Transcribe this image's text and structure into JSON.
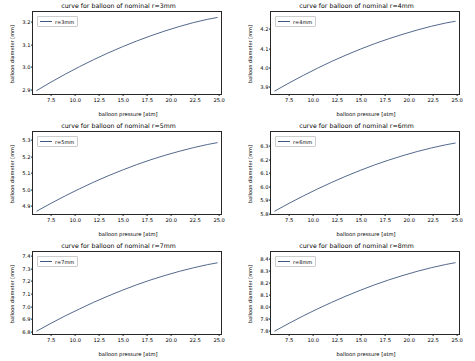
{
  "figure": {
    "background": "#ffffff",
    "line_color": "#40587f",
    "rows": 3,
    "cols": 2
  },
  "chart_data": [
    {
      "type": "line",
      "title": "curve for balloon of nominal r=3mm",
      "xlabel": "balloon pressure [atm]",
      "ylabel": "balloon diameter [mm]",
      "legend": [
        "r=3mm"
      ],
      "legend_position": "upper left",
      "grid": false,
      "xlim": [
        5.6,
        25.4
      ],
      "ylim": [
        2.872,
        3.244
      ],
      "xticks": [
        "7.5",
        "10.0",
        "12.5",
        "15.0",
        "17.5",
        "20.0",
        "22.5",
        "25.0"
      ],
      "xtick_values": [
        7.5,
        10.0,
        12.5,
        15.0,
        17.5,
        20.0,
        22.5,
        25.0
      ],
      "yticks": [
        "2.9",
        "3.0",
        "3.1",
        "3.2"
      ],
      "ytick_values": [
        2.9,
        3.0,
        3.1,
        3.2
      ],
      "x": [
        6.0,
        7.5,
        9.0,
        10.5,
        12.0,
        13.5,
        15.0,
        16.5,
        18.0,
        19.5,
        21.0,
        22.5,
        24.0,
        25.0
      ],
      "y": [
        2.888,
        2.926,
        2.962,
        2.996,
        3.028,
        3.058,
        3.086,
        3.112,
        3.136,
        3.158,
        3.178,
        3.196,
        3.211,
        3.219
      ]
    },
    {
      "type": "line",
      "title": "curve for balloon of nominal r=4mm",
      "xlabel": "balloon pressure [atm]",
      "ylabel": "balloon diameter [mm]",
      "legend": [
        "r=4mm"
      ],
      "legend_position": "upper left",
      "grid": false,
      "xlim": [
        5.6,
        25.4
      ],
      "ylim": [
        3.856,
        4.288
      ],
      "xticks": [
        "7.5",
        "10.0",
        "12.5",
        "15.0",
        "17.5",
        "20.0",
        "22.5",
        "25.0"
      ],
      "xtick_values": [
        7.5,
        10.0,
        12.5,
        15.0,
        17.5,
        20.0,
        22.5,
        25.0
      ],
      "yticks": [
        "3.9",
        "4.0",
        "4.1",
        "4.2"
      ],
      "ytick_values": [
        3.9,
        4.0,
        4.1,
        4.2
      ],
      "x": [
        6.0,
        7.5,
        9.0,
        10.5,
        12.0,
        13.5,
        15.0,
        16.5,
        18.0,
        19.5,
        21.0,
        22.5,
        24.0,
        25.0
      ],
      "y": [
        3.872,
        3.914,
        3.954,
        3.992,
        4.028,
        4.061,
        4.092,
        4.121,
        4.147,
        4.171,
        4.193,
        4.213,
        4.23,
        4.239
      ]
    },
    {
      "type": "line",
      "title": "curve for balloon of nominal r=5mm",
      "xlabel": "balloon pressure [atm]",
      "ylabel": "balloon diameter [mm]",
      "legend": [
        "r=5mm"
      ],
      "legend_position": "upper left",
      "grid": false,
      "xlim": [
        5.6,
        25.4
      ],
      "ylim": [
        4.838,
        5.352
      ],
      "xticks": [
        "7.5",
        "10.0",
        "12.5",
        "15.0",
        "17.5",
        "20.0",
        "22.5",
        "25.0"
      ],
      "xtick_values": [
        7.5,
        10.0,
        12.5,
        15.0,
        17.5,
        20.0,
        22.5,
        25.0
      ],
      "yticks": [
        "4.9",
        "5.0",
        "5.1",
        "5.2",
        "5.3"
      ],
      "ytick_values": [
        4.9,
        5.0,
        5.1,
        5.2,
        5.3
      ],
      "x": [
        6.0,
        7.5,
        9.0,
        10.5,
        12.0,
        13.5,
        15.0,
        16.5,
        18.0,
        19.5,
        21.0,
        22.5,
        24.0,
        25.0
      ],
      "y": [
        4.856,
        4.905,
        4.952,
        4.996,
        5.038,
        5.077,
        5.113,
        5.147,
        5.178,
        5.206,
        5.231,
        5.254,
        5.274,
        5.285
      ]
    },
    {
      "type": "line",
      "title": "curve for balloon of nominal r=6mm",
      "xlabel": "balloon pressure [atm]",
      "ylabel": "balloon diameter [mm]",
      "legend": [
        "r=6mm"
      ],
      "legend_position": "upper left",
      "grid": false,
      "xlim": [
        5.6,
        25.4
      ],
      "ylim": [
        5.782,
        6.404
      ],
      "xticks": [
        "7.5",
        "10.0",
        "12.5",
        "15.0",
        "17.5",
        "20.0",
        "22.5",
        "25.0"
      ],
      "xtick_values": [
        7.5,
        10.0,
        12.5,
        15.0,
        17.5,
        20.0,
        22.5,
        25.0
      ],
      "yticks": [
        "5.8",
        "5.9",
        "6.0",
        "6.1",
        "6.2",
        "6.3"
      ],
      "ytick_values": [
        5.8,
        5.9,
        6.0,
        6.1,
        6.2,
        6.3
      ],
      "x": [
        6.0,
        7.5,
        9.0,
        10.5,
        12.0,
        13.5,
        15.0,
        16.5,
        18.0,
        19.5,
        21.0,
        22.5,
        24.0,
        25.0
      ],
      "y": [
        5.804,
        5.863,
        5.919,
        5.972,
        6.022,
        6.069,
        6.113,
        6.154,
        6.191,
        6.225,
        6.256,
        6.283,
        6.307,
        6.32
      ]
    },
    {
      "type": "line",
      "title": "curve for balloon of nominal r=7mm",
      "xlabel": "balloon pressure [atm]",
      "ylabel": "balloon diameter [mm]",
      "legend": [
        "r=7mm"
      ],
      "legend_position": "upper left",
      "grid": false,
      "xlim": [
        5.6,
        25.4
      ],
      "ylim": [
        6.768,
        7.432
      ],
      "xticks": [
        "7.5",
        "10.0",
        "12.5",
        "15.0",
        "17.5",
        "20.0",
        "22.5",
        "25.0"
      ],
      "xtick_values": [
        7.5,
        10.0,
        12.5,
        15.0,
        17.5,
        20.0,
        22.5,
        25.0
      ],
      "yticks": [
        "6.8",
        "6.9",
        "7.0",
        "7.1",
        "7.2",
        "7.3",
        "7.4"
      ],
      "ytick_values": [
        6.8,
        6.9,
        7.0,
        7.1,
        7.2,
        7.3,
        7.4
      ],
      "x": [
        6.0,
        7.5,
        9.0,
        10.5,
        12.0,
        13.5,
        15.0,
        16.5,
        18.0,
        19.5,
        21.0,
        22.5,
        24.0,
        25.0
      ],
      "y": [
        6.792,
        6.855,
        6.915,
        6.971,
        7.025,
        7.075,
        7.122,
        7.166,
        7.206,
        7.242,
        7.275,
        7.304,
        7.33,
        7.344
      ]
    },
    {
      "type": "line",
      "title": "curve for balloon of nominal r=8mm",
      "xlabel": "balloon pressure [atm]",
      "ylabel": "balloon diameter [mm]",
      "legend": [
        "r=8mm"
      ],
      "legend_position": "upper left",
      "grid": false,
      "xlim": [
        5.6,
        25.4
      ],
      "ylim": [
        7.762,
        8.458
      ],
      "xticks": [
        "7.5",
        "10.0",
        "12.5",
        "15.0",
        "17.5",
        "20.0",
        "22.5",
        "25.0"
      ],
      "xtick_values": [
        7.5,
        10.0,
        12.5,
        15.0,
        17.5,
        20.0,
        22.5,
        25.0
      ],
      "yticks": [
        "7.8",
        "7.9",
        "8.0",
        "8.1",
        "8.2",
        "8.3",
        "8.4"
      ],
      "ytick_values": [
        7.8,
        7.9,
        8.0,
        8.1,
        8.2,
        8.3,
        8.4
      ],
      "x": [
        6.0,
        7.5,
        9.0,
        10.5,
        12.0,
        13.5,
        15.0,
        16.5,
        18.0,
        19.5,
        21.0,
        22.5,
        24.0,
        25.0
      ],
      "y": [
        7.787,
        7.853,
        7.916,
        7.975,
        8.031,
        8.084,
        8.133,
        8.179,
        8.221,
        8.259,
        8.294,
        8.325,
        8.352,
        8.367
      ]
    }
  ]
}
